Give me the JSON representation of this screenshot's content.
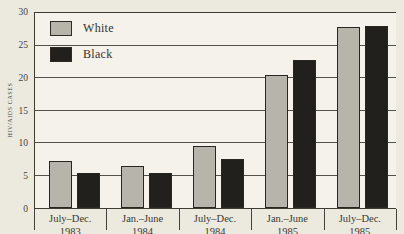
{
  "figure": {
    "background": "#ece9de",
    "plot_background": "#f4f2ea",
    "gridline_color": "#53524a",
    "axis_color": "#3c3b34",
    "text_color": "#3a3933"
  },
  "chart_data": {
    "type": "bar",
    "title": "",
    "xlabel": "",
    "ylabel": "HIV/AIDS Cases",
    "ylim": [
      0,
      30
    ],
    "yticks": [
      0,
      5,
      10,
      15,
      20,
      25,
      30
    ],
    "grid": "horizontal",
    "legend_position": "top-left-inside",
    "categories": [
      "July–Dec.\n1983",
      "Jan.–June\n1984",
      "July–Dec.\n1984",
      "Jan.–June\n1985",
      "July–Dec.\n1985"
    ],
    "series": [
      {
        "name": "White",
        "color": "#b7b4ab",
        "values": [
          7.3,
          6.5,
          9.5,
          20.5,
          27.8
        ]
      },
      {
        "name": "Black",
        "color": "#21201d",
        "values": [
          5.4,
          5.4,
          7.5,
          22.8,
          28
        ]
      }
    ]
  }
}
